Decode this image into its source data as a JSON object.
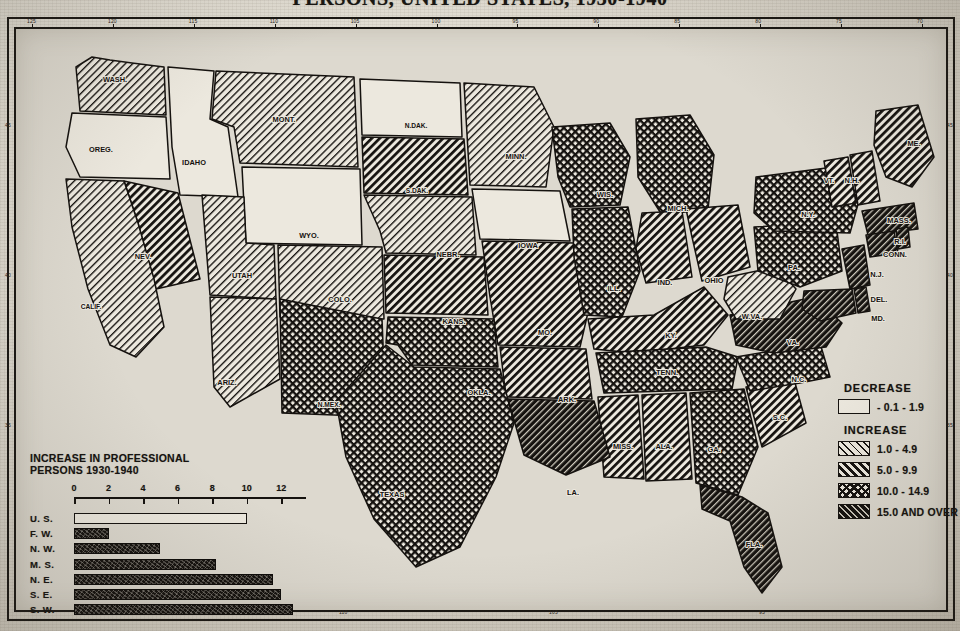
{
  "title": "PERSONS, UNITED STATES, 1930-1940",
  "frame": {
    "longitude_ticks_top": [
      "125",
      "120",
      "115",
      "110",
      "105",
      "100",
      "95",
      "90",
      "85",
      "80",
      "75",
      "70"
    ],
    "longitude_ticks_bottom": [
      "115",
      "110",
      "105",
      "95"
    ],
    "latitude_ticks_left": [
      "45",
      "40",
      "35"
    ],
    "latitude_ticks_right": [
      "45",
      "40",
      "35"
    ]
  },
  "legend": {
    "decrease_heading": "DECREASE",
    "increase_heading": "INCREASE",
    "entries": [
      {
        "label": "- 0.1 -  1.9",
        "pattern": "white",
        "group": "decrease"
      },
      {
        "label": "1.0 -  4.9",
        "pattern": "hatch1",
        "group": "increase"
      },
      {
        "label": "5.0 -  9.9",
        "pattern": "hatch2",
        "group": "increase"
      },
      {
        "label": "10.0 - 14.9",
        "pattern": "cross",
        "group": "increase"
      },
      {
        "label": "15.0 AND OVER",
        "pattern": "dense",
        "group": "increase"
      }
    ]
  },
  "chart_data": {
    "type": "bar",
    "title": "INCREASE IN PROFESSIONAL PERSONS 1930-1940",
    "title_line1": "INCREASE IN PROFESSIONAL",
    "title_line2": "PERSONS 1930-1940",
    "orientation": "horizontal",
    "categories": [
      "U. S.",
      "F. W.",
      "N. W.",
      "M. S.",
      "N. E.",
      "S. E.",
      "S. W."
    ],
    "values": [
      10.0,
      2.0,
      5.0,
      8.2,
      11.5,
      12.0,
      12.7
    ],
    "styles": [
      "hollow",
      "solid",
      "solid",
      "solid",
      "solid",
      "solid",
      "solid"
    ],
    "xlabel": "",
    "ylabel": "",
    "xlim": [
      0,
      13.2
    ],
    "tick_labels": [
      "0",
      "2",
      "4",
      "6",
      "8",
      "10",
      "12"
    ],
    "tick_values": [
      0,
      2,
      4,
      6,
      8,
      10,
      12
    ],
    "grid": false,
    "legend": "none"
  },
  "map": {
    "states": [
      {
        "abbr": "WASH.",
        "x": 101,
        "y": 55,
        "cls": "hatch1"
      },
      {
        "abbr": "OREG.",
        "x": 87,
        "y": 125,
        "cls": "white"
      },
      {
        "abbr": "IDAHO",
        "x": 180,
        "y": 138,
        "cls": "white"
      },
      {
        "abbr": "MONT.",
        "x": 270,
        "y": 95,
        "cls": "hatch1"
      },
      {
        "abbr": "N.DAK.",
        "x": 402,
        "y": 101,
        "cls": "white"
      },
      {
        "abbr": "MINN.",
        "x": 502,
        "y": 132,
        "cls": "hatch1"
      },
      {
        "abbr": "S.DAK.",
        "x": 403,
        "y": 166,
        "cls": "hatch2"
      },
      {
        "abbr": "WYO.",
        "x": 295,
        "y": 211,
        "cls": "white"
      },
      {
        "abbr": "NEV.",
        "x": 129,
        "y": 232,
        "cls": "hatch2"
      },
      {
        "abbr": "UTAH",
        "x": 228,
        "y": 251,
        "cls": "hatch1"
      },
      {
        "abbr": "CALIF.",
        "x": 77,
        "y": 282,
        "cls": "hatch1"
      },
      {
        "abbr": "COLO.",
        "x": 326,
        "y": 275,
        "cls": "hatch1"
      },
      {
        "abbr": "NEBR.",
        "x": 434,
        "y": 230,
        "cls": "hatch1"
      },
      {
        "abbr": "IOWA",
        "x": 514,
        "y": 221,
        "cls": "white"
      },
      {
        "abbr": "KANS.",
        "x": 440,
        "y": 297,
        "cls": "hatch2"
      },
      {
        "abbr": "MO.",
        "x": 531,
        "y": 308,
        "cls": "hatch2"
      },
      {
        "abbr": "WIS.",
        "x": 591,
        "y": 170,
        "cls": "cross"
      },
      {
        "abbr": "MICH.",
        "x": 664,
        "y": 184,
        "cls": "cross"
      },
      {
        "abbr": "ILL.",
        "x": 600,
        "y": 264,
        "cls": "cross"
      },
      {
        "abbr": "IND.",
        "x": 651,
        "y": 258,
        "cls": "hatch2"
      },
      {
        "abbr": "OHIO",
        "x": 700,
        "y": 256,
        "cls": "hatch2"
      },
      {
        "abbr": "KY.",
        "x": 657,
        "y": 311,
        "cls": "hatch2"
      },
      {
        "abbr": "TENN.",
        "x": 653,
        "y": 348,
        "cls": "cross"
      },
      {
        "abbr": "ARIZ.",
        "x": 213,
        "y": 358,
        "cls": "hatch1"
      },
      {
        "abbr": "N.MEX.",
        "x": 315,
        "y": 380,
        "cls": "cross"
      },
      {
        "abbr": "OKLA.",
        "x": 465,
        "y": 368,
        "cls": "cross"
      },
      {
        "abbr": "ARK.",
        "x": 553,
        "y": 375,
        "cls": "hatch2"
      },
      {
        "abbr": "TEXAS",
        "x": 378,
        "y": 470,
        "cls": "cross"
      },
      {
        "abbr": "MISS.",
        "x": 609,
        "y": 422,
        "cls": "hatch2"
      },
      {
        "abbr": "ALA.",
        "x": 650,
        "y": 422,
        "cls": "hatch2"
      },
      {
        "abbr": "LA.",
        "x": 559,
        "y": 468,
        "cls": "dense"
      },
      {
        "abbr": "GA.",
        "x": 700,
        "y": 425,
        "cls": "cross"
      },
      {
        "abbr": "FLA.",
        "x": 740,
        "y": 520,
        "cls": "dense"
      },
      {
        "abbr": "S.C.",
        "x": 766,
        "y": 393,
        "cls": "hatch2"
      },
      {
        "abbr": "N.C.",
        "x": 785,
        "y": 355,
        "cls": "cross"
      },
      {
        "abbr": "VA.",
        "x": 779,
        "y": 318,
        "cls": "dense"
      },
      {
        "abbr": "W.VA.",
        "x": 738,
        "y": 292,
        "cls": "hatch1"
      },
      {
        "abbr": "PA.",
        "x": 780,
        "y": 243,
        "cls": "cross"
      },
      {
        "abbr": "N.Y.",
        "x": 794,
        "y": 190,
        "cls": "cross"
      },
      {
        "abbr": "N.J.",
        "x": 863,
        "y": 250,
        "cls": "dense"
      },
      {
        "abbr": "DEL.",
        "x": 865,
        "y": 275,
        "cls": "dense"
      },
      {
        "abbr": "MD.",
        "x": 864,
        "y": 294,
        "cls": "dense"
      },
      {
        "abbr": "VT.",
        "x": 815,
        "y": 156,
        "cls": "hatch2"
      },
      {
        "abbr": "N.H.",
        "x": 838,
        "y": 156,
        "cls": "hatch2"
      },
      {
        "abbr": "ME.",
        "x": 900,
        "y": 119,
        "cls": "hatch2"
      },
      {
        "abbr": "MASS.",
        "x": 885,
        "y": 196,
        "cls": "dense"
      },
      {
        "abbr": "R.I.",
        "x": 886,
        "y": 217,
        "cls": "dense"
      },
      {
        "abbr": "CONN.",
        "x": 881,
        "y": 230,
        "cls": "dense"
      }
    ]
  }
}
